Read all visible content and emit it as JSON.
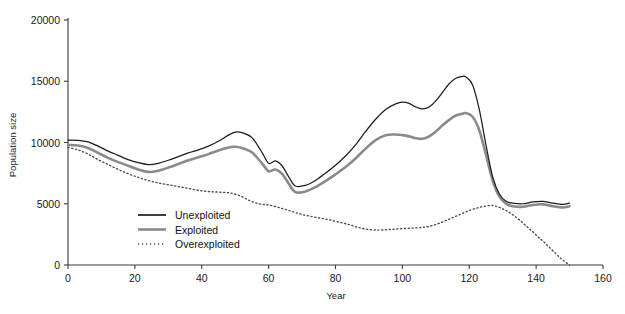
{
  "chart_data": {
    "type": "line",
    "title": "",
    "xlabel": "Year",
    "ylabel": "Population size",
    "xlim": [
      0,
      160
    ],
    "ylim": [
      0,
      20000
    ],
    "xticks": [
      "0",
      "20",
      "40",
      "60",
      "80",
      "100",
      "120",
      "140",
      "160"
    ],
    "yticks": [
      "0",
      "5000",
      "10000",
      "15000",
      "20000"
    ],
    "grid": false,
    "legend_position": "inside lower-left",
    "colors": {
      "unexploited": "#1c1c1c",
      "exploited": "#8a8a8a",
      "overexploited": "#4a4a4a",
      "axis": "#3a3a3a",
      "background": "#ffffff"
    },
    "series": [
      {
        "name": "Unexploited",
        "style": "solid-black",
        "x": [
          0,
          3,
          6,
          9,
          12,
          15,
          18,
          21,
          24,
          27,
          30,
          33,
          36,
          39,
          42,
          45,
          48,
          50,
          52,
          55,
          58,
          60,
          62,
          64,
          66,
          68,
          71,
          74,
          77,
          80,
          83,
          86,
          89,
          92,
          95,
          98,
          100,
          102,
          104,
          106,
          108,
          110,
          112,
          114,
          116,
          118,
          119,
          121,
          123,
          125,
          127,
          129,
          131,
          133,
          136,
          139,
          142,
          145,
          148,
          150
        ],
        "values": [
          10200,
          10180,
          10050,
          9700,
          9300,
          8950,
          8600,
          8350,
          8200,
          8300,
          8550,
          8850,
          9150,
          9400,
          9700,
          10100,
          10600,
          10850,
          10800,
          10400,
          9200,
          8300,
          8500,
          8100,
          7200,
          6450,
          6500,
          6900,
          7500,
          8150,
          8900,
          9800,
          10900,
          11900,
          12700,
          13150,
          13300,
          13200,
          12900,
          12750,
          12900,
          13400,
          14100,
          14800,
          15250,
          15400,
          15350,
          14700,
          12700,
          9800,
          7200,
          5800,
          5200,
          5050,
          5000,
          5150,
          5200,
          5050,
          4950,
          5050
        ]
      },
      {
        "name": "Exploited",
        "style": "solid-gray",
        "x": [
          0,
          3,
          6,
          9,
          12,
          15,
          18,
          21,
          24,
          27,
          30,
          33,
          36,
          39,
          42,
          45,
          48,
          50,
          52,
          55,
          58,
          60,
          62,
          64,
          66,
          68,
          71,
          74,
          77,
          80,
          83,
          86,
          89,
          92,
          95,
          98,
          100,
          102,
          104,
          106,
          108,
          110,
          112,
          114,
          116,
          118,
          119,
          121,
          123,
          125,
          127,
          129,
          131,
          133,
          136,
          139,
          142,
          145,
          148,
          150
        ],
        "values": [
          9800,
          9750,
          9550,
          9150,
          8750,
          8400,
          8100,
          7800,
          7600,
          7700,
          7950,
          8250,
          8550,
          8800,
          9050,
          9350,
          9600,
          9650,
          9550,
          9200,
          8300,
          7650,
          7800,
          7450,
          6650,
          5950,
          6000,
          6350,
          6850,
          7400,
          8000,
          8700,
          9500,
          10200,
          10600,
          10650,
          10600,
          10500,
          10350,
          10300,
          10500,
          10900,
          11400,
          11850,
          12200,
          12350,
          12400,
          12100,
          11000,
          9000,
          6900,
          5600,
          5000,
          4800,
          4750,
          4900,
          4950,
          4800,
          4700,
          4800
        ]
      },
      {
        "name": "Overexploited",
        "style": "dotted",
        "x": [
          0,
          3,
          6,
          9,
          12,
          15,
          18,
          21,
          24,
          27,
          30,
          33,
          36,
          39,
          42,
          45,
          48,
          51,
          54,
          57,
          60,
          63,
          66,
          69,
          72,
          75,
          78,
          81,
          84,
          87,
          90,
          93,
          96,
          99,
          102,
          105,
          108,
          111,
          114,
          117,
          120,
          123,
          126,
          128,
          131,
          134,
          137,
          140,
          143,
          146,
          148,
          150
        ],
        "values": [
          9600,
          9400,
          9050,
          8600,
          8200,
          7800,
          7450,
          7150,
          6900,
          6700,
          6550,
          6400,
          6250,
          6100,
          6000,
          5950,
          5900,
          5700,
          5300,
          5000,
          4900,
          4700,
          4450,
          4200,
          4000,
          3850,
          3700,
          3500,
          3300,
          3050,
          2900,
          2850,
          2900,
          2950,
          3000,
          3050,
          3150,
          3400,
          3750,
          4100,
          4450,
          4700,
          4850,
          4800,
          4450,
          3900,
          3200,
          2450,
          1700,
          900,
          400,
          0
        ]
      }
    ]
  },
  "legend": {
    "items": [
      {
        "label": "Unexploited",
        "style": "solid-black"
      },
      {
        "label": "Exploited",
        "style": "solid-gray"
      },
      {
        "label": "Overexploited",
        "style": "dotted"
      }
    ]
  }
}
